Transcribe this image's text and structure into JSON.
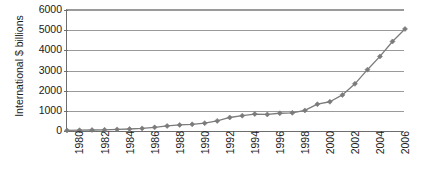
{
  "chart_data": {
    "type": "line",
    "title": "",
    "xlabel": "",
    "ylabel": "International $ billions",
    "ylim": [
      0,
      6000
    ],
    "xlim": [
      1981,
      2008
    ],
    "grid": true,
    "legend": false,
    "legend_position": "none",
    "marker": "diamond",
    "series_color": "#7b7b7b",
    "y_ticks": [
      6000,
      5000,
      4000,
      3000,
      2000,
      1000,
      0
    ],
    "y_tick_labels": [
      "6000",
      "5000",
      "4000",
      "3000",
      "2000",
      "1000",
      "0"
    ],
    "x_tick_labels": [
      "1980",
      "1982",
      "1984",
      "1986",
      "1988",
      "1990",
      "1992",
      "1994",
      "1996",
      "1998",
      "2000",
      "2002",
      "2004",
      "2006",
      "2008"
    ],
    "x_tick_values": [
      1980,
      1982,
      1984,
      1986,
      1988,
      1990,
      1992,
      1994,
      1996,
      1998,
      2000,
      2002,
      2004,
      2006,
      2008
    ],
    "x": [
      1981,
      1982,
      1983,
      1984,
      1985,
      1986,
      1987,
      1988,
      1989,
      1990,
      1991,
      1992,
      1993,
      1994,
      1995,
      1996,
      1997,
      1998,
      1999,
      2000,
      2001,
      2002,
      2003,
      2004,
      2005,
      2006,
      2007,
      2008
    ],
    "values": [
      30,
      40,
      50,
      60,
      80,
      100,
      130,
      180,
      250,
      300,
      330,
      390,
      500,
      670,
      760,
      840,
      820,
      880,
      900,
      1020,
      1330,
      1450,
      1790,
      2340,
      3040,
      3700,
      4440,
      5060
    ],
    "series": [
      {
        "name": "International $ billions",
        "color": "#7b7b7b",
        "values": [
          30,
          40,
          50,
          60,
          80,
          100,
          130,
          180,
          250,
          300,
          330,
          390,
          500,
          670,
          760,
          840,
          820,
          880,
          900,
          1020,
          1330,
          1450,
          1790,
          2340,
          3040,
          3700,
          4440,
          5060
        ]
      }
    ],
    "last_point": {
      "x": 2008,
      "y": 5060
    },
    "colors": {
      "axis": "#6e6e6e",
      "grid": "#9a9a9a",
      "text": "#1a1a1a",
      "line": "#7b7b7b",
      "background": "#ffffff"
    }
  }
}
